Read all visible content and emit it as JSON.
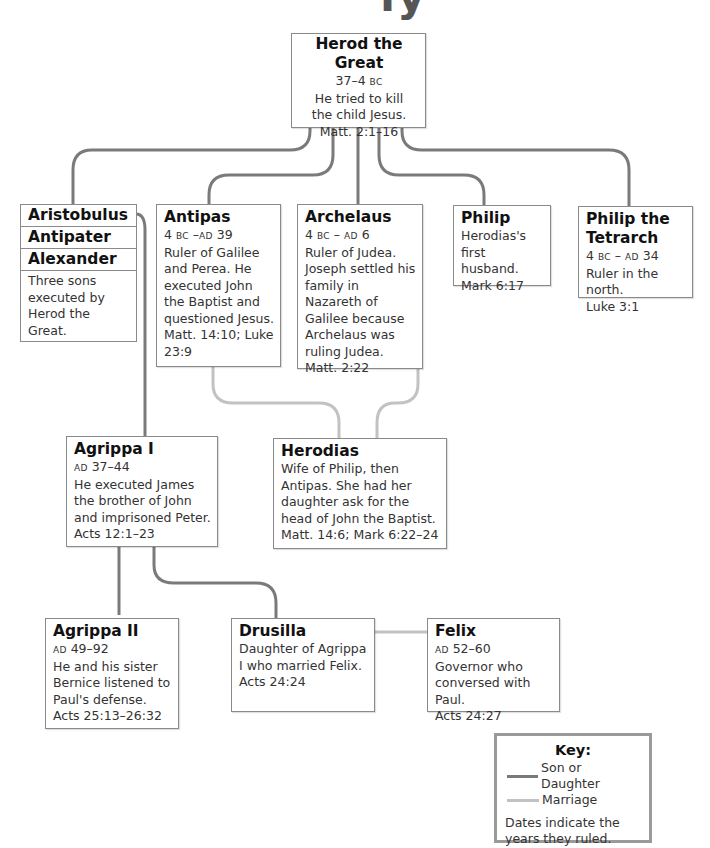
{
  "diagram": {
    "title_fragment": "ly ",
    "colors": {
      "son_or_daughter": "#7a7a7a",
      "marriage": "#c2c2c2",
      "box_border": "#8a8a8a"
    },
    "people": {
      "herod_the_great": {
        "name": "Herod the Great",
        "dates_num": "37–4",
        "dates_era": "BC",
        "desc": "He tried to kill the child Jesus.",
        "ref": "Matt. 2:1–16"
      },
      "three_sons": {
        "names": [
          "Aristobulus",
          "Antipater",
          "Alexander"
        ],
        "desc": "Three sons executed by Herod the Great."
      },
      "antipas": {
        "name": "Antipas",
        "dates_a": "4",
        "era_a": "BC",
        "sep": " –",
        "era_b": "AD",
        "dates_b": " 39",
        "desc": "Ruler of Galilee and Perea. He executed John the Baptist and questioned Jesus.",
        "ref": "Matt. 14:10; Luke 23:9"
      },
      "archelaus": {
        "name": "Archelaus",
        "dates_a": "4",
        "era_a": "BC",
        "sep": " – ",
        "era_b": "AD",
        "dates_b": " 6",
        "desc": "Ruler of Judea. Joseph settled his family in Nazareth of Galilee because Archelaus was ruling Judea.",
        "ref": "Matt. 2:22"
      },
      "philip": {
        "name": "Philip",
        "desc": "Herodias's first husband.",
        "ref": "Mark 6:17"
      },
      "philip_tetrarch": {
        "name": "Philip the Tetrarch",
        "dates_a": "4",
        "era_a": "BC",
        "sep": " – ",
        "era_b": "AD",
        "dates_b": " 34",
        "desc": "Ruler in the north.",
        "ref": "Luke 3:1"
      },
      "agrippa_i": {
        "name": "Agrippa I",
        "era": "AD",
        "dates": " 37–44",
        "desc": "He executed James the brother of John and imprisoned Peter.",
        "ref": "Acts 12:1–23"
      },
      "herodias": {
        "name": "Herodias",
        "desc": "Wife of Philip, then Antipas. She had her daughter ask for the head of John the Baptist.",
        "ref": "Matt. 14:6; Mark 6:22–24"
      },
      "agrippa_ii": {
        "name": "Agrippa II",
        "era": "AD",
        "dates": " 49–92",
        "desc": "He and his sister Bernice listened to Paul's defense.",
        "ref": "Acts 25:13–26:32"
      },
      "drusilla": {
        "name": "Drusilla",
        "desc": "Daughter of Agrippa I who married Felix.",
        "ref": "Acts 24:24"
      },
      "felix": {
        "name": "Felix",
        "era": "AD",
        "dates": " 52–60",
        "desc": "Governor who conversed with Paul.",
        "ref": "Acts 24:27"
      }
    },
    "key": {
      "title": "Key:",
      "items": [
        {
          "label": "Son or Daughter",
          "type": "son_or_daughter"
        },
        {
          "label": "Marriage",
          "type": "marriage"
        }
      ],
      "note": "Dates indicate the years they ruled."
    }
  }
}
